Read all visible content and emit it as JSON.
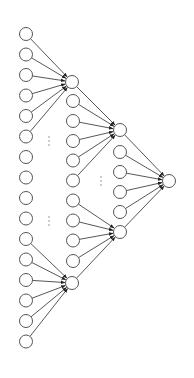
{
  "diagram": {
    "type": "tree-network",
    "colors": {
      "background": "#ffffff",
      "stroke": "#555555",
      "edge": "#444444",
      "arrow": "#222222",
      "ellipsis": "#888888"
    },
    "node_radius": 6.5,
    "nodes": [
      {
        "id": "in0",
        "x": 26,
        "y": 34
      },
      {
        "id": "in1",
        "x": 26,
        "y": 54.5
      },
      {
        "id": "in2",
        "x": 26,
        "y": 75
      },
      {
        "id": "in3",
        "x": 26,
        "y": 95.5
      },
      {
        "id": "in4",
        "x": 26,
        "y": 116
      },
      {
        "id": "in5",
        "x": 26,
        "y": 136.5
      },
      {
        "id": "in6",
        "x": 26,
        "y": 157
      },
      {
        "id": "in7",
        "x": 26,
        "y": 177.5
      },
      {
        "id": "in8",
        "x": 26,
        "y": 198
      },
      {
        "id": "in9",
        "x": 26,
        "y": 218.5
      },
      {
        "id": "in10",
        "x": 26,
        "y": 239
      },
      {
        "id": "in11",
        "x": 26,
        "y": 259.5
      },
      {
        "id": "in12",
        "x": 26,
        "y": 280
      },
      {
        "id": "in13",
        "x": 26,
        "y": 300.5
      },
      {
        "id": "in14",
        "x": 26,
        "y": 321
      },
      {
        "id": "in15",
        "x": 26,
        "y": 341.5
      },
      {
        "id": "A",
        "x": 72,
        "y": 82
      },
      {
        "id": "m0",
        "x": 73,
        "y": 101
      },
      {
        "id": "m1",
        "x": 73,
        "y": 121
      },
      {
        "id": "m2",
        "x": 73,
        "y": 141
      },
      {
        "id": "m3",
        "x": 73,
        "y": 160.5
      },
      {
        "id": "m4",
        "x": 73,
        "y": 180.5
      },
      {
        "id": "m5",
        "x": 73,
        "y": 200.5
      },
      {
        "id": "m6",
        "x": 73,
        "y": 220.5
      },
      {
        "id": "m7",
        "x": 73,
        "y": 240.5
      },
      {
        "id": "m8",
        "x": 73,
        "y": 261
      },
      {
        "id": "B",
        "x": 72,
        "y": 283
      },
      {
        "id": "C",
        "x": 120,
        "y": 130
      },
      {
        "id": "t0",
        "x": 120,
        "y": 152
      },
      {
        "id": "t1",
        "x": 120,
        "y": 172
      },
      {
        "id": "t2",
        "x": 120,
        "y": 192
      },
      {
        "id": "t3",
        "x": 120,
        "y": 212
      },
      {
        "id": "D",
        "x": 120,
        "y": 232
      },
      {
        "id": "OUT",
        "x": 169,
        "y": 181
      }
    ],
    "edges": [
      [
        "in0",
        "A"
      ],
      [
        "in1",
        "A"
      ],
      [
        "in2",
        "A"
      ],
      [
        "in3",
        "A"
      ],
      [
        "in4",
        "A"
      ],
      [
        "in5",
        "A"
      ],
      [
        "in10",
        "B"
      ],
      [
        "in11",
        "B"
      ],
      [
        "in12",
        "B"
      ],
      [
        "in13",
        "B"
      ],
      [
        "in14",
        "B"
      ],
      [
        "in15",
        "B"
      ],
      [
        "A",
        "C"
      ],
      [
        "m0",
        "C"
      ],
      [
        "m1",
        "C"
      ],
      [
        "m2",
        "C"
      ],
      [
        "m3",
        "C"
      ],
      [
        "m4",
        "C"
      ],
      [
        "m5",
        "D"
      ],
      [
        "m6",
        "D"
      ],
      [
        "m7",
        "D"
      ],
      [
        "m8",
        "D"
      ],
      [
        "B",
        "D"
      ],
      [
        "C",
        "OUT"
      ],
      [
        "t0",
        "OUT"
      ],
      [
        "t1",
        "OUT"
      ],
      [
        "t2",
        "OUT"
      ],
      [
        "t3",
        "OUT"
      ],
      [
        "D",
        "OUT"
      ]
    ],
    "ellipses": [
      {
        "id": "ellipsis-inputs-top",
        "x": 49,
        "y": 137
      },
      {
        "id": "ellipsis-inputs-bottom",
        "x": 49,
        "y": 217
      },
      {
        "id": "ellipsis-middle",
        "x": 101,
        "y": 177
      }
    ],
    "ellipsis_symbol": "⋮"
  }
}
